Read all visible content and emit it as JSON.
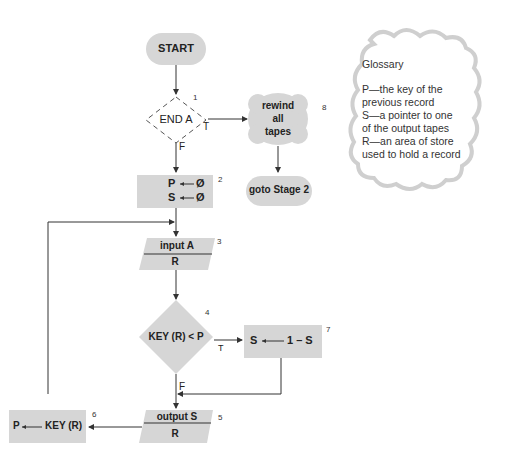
{
  "flowchart": {
    "start": {
      "label": "START"
    },
    "node1": {
      "label": "END  A",
      "number": "1",
      "true_label": "T",
      "false_label": "F"
    },
    "node2": {
      "line1_lhs": "P",
      "line1_rhs": "Ø",
      "line2_lhs": "S",
      "line2_rhs": "Ø",
      "number": "2"
    },
    "node3": {
      "top": "input A",
      "bottom": "R",
      "number": "3"
    },
    "node4": {
      "label": "KEY (R) < P",
      "number": "4",
      "true_label": "T",
      "false_label": "F"
    },
    "node5": {
      "top": "output S",
      "bottom": "R",
      "number": "5"
    },
    "node6": {
      "lhs": "P",
      "rhs": "KEY (R)",
      "number": "6"
    },
    "node7": {
      "lhs": "S",
      "rhs": "1 – S",
      "number": "7"
    },
    "node8": {
      "line1": "rewind",
      "line2": "all",
      "line3": "tapes",
      "number": "8"
    },
    "goto": {
      "label": "goto Stage 2"
    }
  },
  "glossary": {
    "title": "Glossary",
    "lines": [
      "P—the key of the",
      "previous record",
      "S—a pointer to one",
      "of the output tapes",
      "R—an area of store",
      "used to hold a record"
    ]
  },
  "colors": {
    "shape_fill": "#d6d6d6",
    "line": "#333333",
    "cloud_edge": "#cfcfcf"
  }
}
